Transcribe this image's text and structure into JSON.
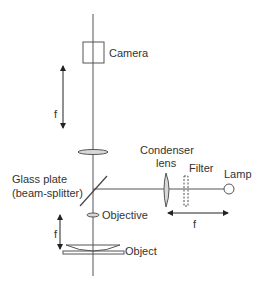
{
  "diagram": {
    "labels": {
      "camera": "Camera",
      "f_upper": "f",
      "condenser_line1": "Condenser",
      "condenser_line2": "lens",
      "filter": "Filter",
      "lamp": "Lamp",
      "glass_plate_line1": "Glass plate",
      "glass_plate_line2": "(beam-splitter)",
      "objective": "Objective",
      "f_lower": "f",
      "object": "Object",
      "f_horizontal": "f"
    },
    "colors": {
      "line": "#555555",
      "text": "#333333",
      "lens_fill": "#d8d8d8"
    }
  }
}
